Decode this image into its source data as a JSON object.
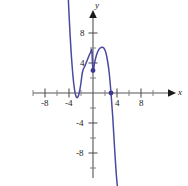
{
  "figure": {
    "background_color": "#ffffff",
    "curve_color": "#4a4a9e",
    "axis_color": "#555555",
    "label_color": "#1a1a1a",
    "width": 188,
    "height": 186
  },
  "axes": {
    "x_axis_name": "x",
    "y_axis_name": "y",
    "x_tick_labels": [
      "-8",
      "-4",
      "4",
      "8"
    ],
    "y_tick_labels": [
      "8",
      "4",
      "-4",
      "-8"
    ],
    "origin_label": ""
  },
  "chart_data": {
    "type": "line",
    "title": "",
    "subtitle": "",
    "xlabel": "x",
    "ylabel": "y",
    "xlim": [
      -10.5,
      8.5
    ],
    "ylim": [
      -10.5,
      10.0
    ],
    "xticks": [
      -8,
      -4,
      4,
      8
    ],
    "yticks": [
      8,
      4,
      -4,
      -8
    ],
    "minor_tick_interval": 2,
    "grid": false,
    "legend": null,
    "legend_position": "none",
    "series": [
      {
        "name": "f(x)",
        "color": "#4a4a9e",
        "kind": "curve",
        "description": "Cubic with negative leading coefficient; rises from lower-left off-screen is not shown — the left branch enters from the top-left, falls to a local minimum, rises to a local maximum, then falls steeply off the bottom-right.",
        "x": [
          -4.2,
          -4.0,
          -3.8,
          -3.6,
          -3.4,
          -3.2,
          -3.0,
          -2.8,
          -2.6,
          -2.4,
          -2.2,
          -2.0,
          -1.8,
          -1.6,
          -1.4,
          -1.2,
          -1.0,
          -0.8,
          -0.6,
          -0.4,
          -0.2,
          0.0,
          0.3,
          0.6,
          0.9,
          1.2,
          1.5,
          1.8,
          2.1,
          2.4,
          2.7,
          3.0,
          3.3,
          3.6,
          3.9,
          4.2
        ],
        "y": [
          14.2,
          10.6,
          7.5,
          4.9,
          2.8,
          1.2,
          0.1,
          -0.5,
          -0.6,
          -0.3,
          0.4,
          1.4,
          2.6,
          3.2,
          3.5,
          3.9,
          4.3,
          4.7,
          5.1,
          5.4,
          5.7,
          3.0,
          4.2,
          5.1,
          5.7,
          6.0,
          6.1,
          6.0,
          5.5,
          4.4,
          2.7,
          0.0,
          -3.3,
          -7.4,
          -11.0,
          -13.5
        ],
        "local_minimum": [
          -2.7,
          -0.6
        ],
        "local_maximum": [
          1.7,
          6.1
        ]
      }
    ],
    "points": [
      {
        "name": "y-intercept",
        "x": 0,
        "y": 3,
        "color": "#3a3a96",
        "marker": "filled-circle",
        "label": ""
      },
      {
        "name": "x-intercept",
        "x": 3,
        "y": 0,
        "color": "#3a3a96",
        "marker": "filled-circle",
        "label": ""
      }
    ]
  }
}
